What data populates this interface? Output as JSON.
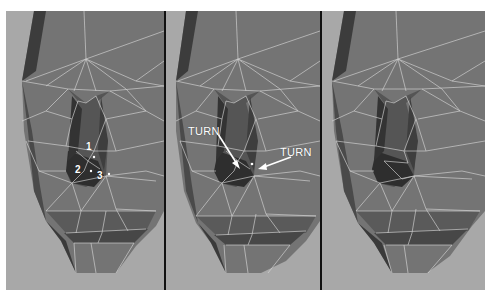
{
  "figure": {
    "panels": [
      {
        "id": "panel-1",
        "description": "Low-poly face mesh with numbered vertices near nose",
        "labels": [
          "1",
          "2",
          "3"
        ]
      },
      {
        "id": "panel-2",
        "description": "Low-poly face mesh with edge turn annotations",
        "annotations": [
          "TURN",
          "TURN"
        ]
      },
      {
        "id": "panel-3",
        "description": "Low-poly face mesh after edge turns"
      }
    ]
  },
  "colors": {
    "background": "#a8a8a8",
    "mesh_face": "#6e6e6e",
    "mesh_shadow": "#3a3a3a",
    "wireframe": "#d8d8d8",
    "divider": "#111111",
    "annotation": "#ffffff"
  }
}
